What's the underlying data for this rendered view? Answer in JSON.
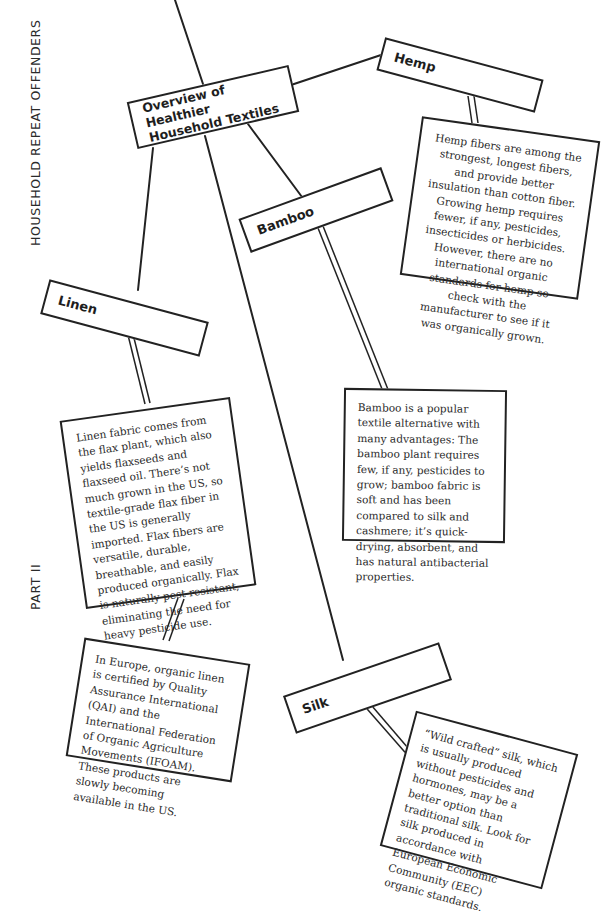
{
  "margin": {
    "section_title": "HOUSEHOLD REPEAT OFFENDERS",
    "part": "PART II"
  },
  "root": {
    "title": "Overview of Healthier Household Textiles"
  },
  "nodes": {
    "hemp": {
      "label": "Hemp",
      "description": "Hemp fibers are among the strongest, longest fibers, and provide better insulation than cotton fiber. Growing hemp requires fewer, if any, pesticides, insecticides or herbicides. However, there are no international organic standards for hemp so check with the manufacturer to see if it was organically grown."
    },
    "bamboo": {
      "label": "Bamboo",
      "description": "Bamboo is a popular textile alternative with many advantages: The bamboo plant requires few, if any, pesticides to grow; bamboo fabric is soft and has been compared to silk and cashmere; it’s quick-drying, absorbent, and has natural antibacterial properties."
    },
    "linen": {
      "label": "Linen",
      "description": "Linen fabric comes from the flax plant, which also yields flaxseeds and flaxseed oil. There’s not much grown in the US, so textile-grade flax fiber in the US is generally imported. Flax fibers are versatile, durable, breathable, and easily produced organically. Flax is naturally pest-resistant, eliminating the need for heavy pesticide use.",
      "note": "In Europe, organic linen is certified by Quality Assurance International (QAI) and the International Federation of Organic Agriculture Movements (IFOAM). These products are slowly becoming available in the US."
    },
    "silk": {
      "label": "Silk",
      "description": "“Wild crafted” silk, which is usually produced without pesticides and hormones, may be a better option than traditional silk. Look for silk produced in accordance with European Economic Community (EEC) organic standards."
    }
  }
}
